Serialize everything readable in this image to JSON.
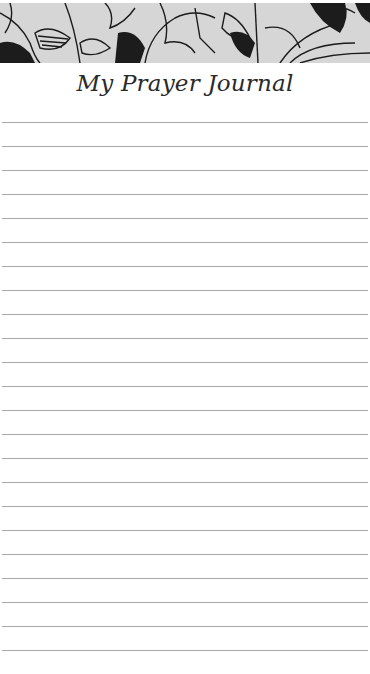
{
  "header": {
    "banner_icon": "floral-line-art-banner",
    "title": "My Prayer Journal"
  },
  "page": {
    "ruled_line_count": 23,
    "line_color": "#a8a8a8",
    "banner_bg": "#d4d4d4"
  }
}
